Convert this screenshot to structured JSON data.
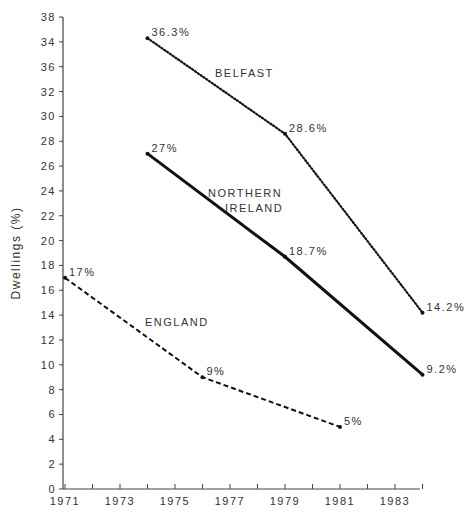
{
  "chart_data": {
    "type": "line",
    "title": "",
    "xlabel": "",
    "ylabel": "Dwellings (%)",
    "xlim": [
      1971,
      1984
    ],
    "ylim": [
      0,
      38
    ],
    "x_ticks": [
      1971,
      1972,
      1973,
      1974,
      1975,
      1976,
      1977,
      1978,
      1979,
      1980,
      1981,
      1982,
      1983,
      1984
    ],
    "x_tick_labels": [
      "1971",
      "1973",
      "1975",
      "1977",
      "1979",
      "1981",
      "1983"
    ],
    "y_tick_labels": [
      "0",
      "2",
      "4",
      "6",
      "8",
      "10",
      "12",
      "14",
      "16",
      "18",
      "20",
      "22",
      "24",
      "26",
      "28",
      "30",
      "32",
      "36",
      "34",
      "38"
    ],
    "grid": false,
    "legend": "inline labels",
    "series": [
      {
        "name": "BELFAST",
        "style": "dotted",
        "x": [
          1974,
          1979,
          1984
        ],
        "values": [
          36.3,
          28.6,
          14.2
        ],
        "labels": [
          "36.3%",
          "28.6%",
          "14.2%"
        ]
      },
      {
        "name": "NORTHERN IRELAND",
        "label_lines": [
          "NORTHERN",
          "IRELAND"
        ],
        "style": "solid",
        "x": [
          1974,
          1979,
          1984
        ],
        "values": [
          27,
          18.7,
          9.2
        ],
        "labels": [
          "27%",
          "18.7%",
          "9.2%"
        ]
      },
      {
        "name": "ENGLAND",
        "style": "dashed",
        "x": [
          1971,
          1976,
          1981
        ],
        "values": [
          17,
          9,
          5
        ],
        "labels": [
          "17%",
          "9%",
          "5%"
        ]
      }
    ]
  }
}
